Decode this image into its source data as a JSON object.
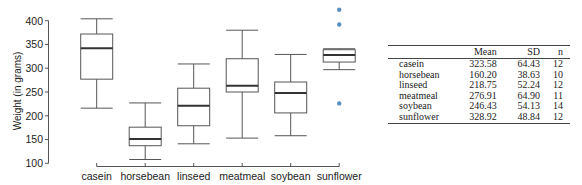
{
  "chart_data": {
    "type": "boxplot",
    "title": "",
    "xlabel": "",
    "ylabel": "Weight (in grams)",
    "ylim": [
      100,
      400
    ],
    "yticks": [
      100,
      150,
      200,
      250,
      300,
      350,
      400
    ],
    "grid": false,
    "legend": null,
    "categories": [
      "casein",
      "horsebean",
      "linseed",
      "meatmeal",
      "soybean",
      "sunflower"
    ],
    "boxes": [
      {
        "category": "casein",
        "whisker_low": 216,
        "q1": 277,
        "median": 342,
        "q3": 372,
        "whisker_high": 404,
        "outliers": []
      },
      {
        "category": "horsebean",
        "whisker_low": 108,
        "q1": 137,
        "median": 151,
        "q3": 176,
        "whisker_high": 227,
        "outliers": []
      },
      {
        "category": "linseed",
        "whisker_low": 141,
        "q1": 179,
        "median": 221,
        "q3": 258,
        "whisker_high": 309,
        "outliers": []
      },
      {
        "category": "meatmeal",
        "whisker_low": 153,
        "q1": 250,
        "median": 263,
        "q3": 320,
        "whisker_high": 380,
        "outliers": []
      },
      {
        "category": "soybean",
        "whisker_low": 158,
        "q1": 206,
        "median": 248,
        "q3": 271,
        "whisker_high": 329,
        "outliers": []
      },
      {
        "category": "sunflower",
        "whisker_low": 297,
        "q1": 313,
        "median": 328,
        "q3": 339,
        "whisker_high": 341,
        "outliers": [
          226,
          392,
          423
        ]
      }
    ],
    "outlier_color": "#5b8fc0",
    "box_color": "#555555"
  },
  "table": {
    "columns": [
      "",
      "Mean",
      "SD",
      "n"
    ],
    "rows": [
      {
        "name": "casein",
        "mean": "323.58",
        "sd": "64.43",
        "n": "12"
      },
      {
        "name": "horsebean",
        "mean": "160.20",
        "sd": "38.63",
        "n": "10"
      },
      {
        "name": "linseed",
        "mean": "218.75",
        "sd": "52.24",
        "n": "12"
      },
      {
        "name": "meatmeal",
        "mean": "276.91",
        "sd": "64.90",
        "n": "11"
      },
      {
        "name": "soybean",
        "mean": "246.43",
        "sd": "54.13",
        "n": "14"
      },
      {
        "name": "sunflower",
        "mean": "328.92",
        "sd": "48.84",
        "n": "12"
      }
    ]
  }
}
